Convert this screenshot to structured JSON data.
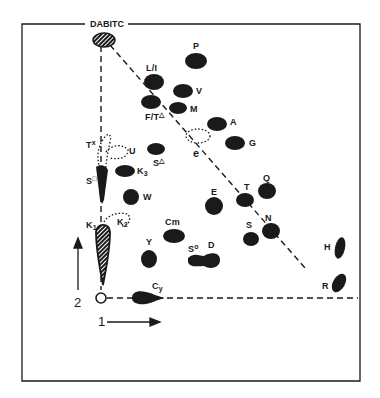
{
  "diagram": {
    "type": "2D thin-layer chromatogram",
    "reference_spot": "DABITC",
    "origin_label": "origin",
    "axes": {
      "dimension_1": {
        "label": "1",
        "direction": "right"
      },
      "dimension_2": {
        "label": "2",
        "direction": "up"
      }
    },
    "colors": {
      "ink": "#1a1a1a",
      "background": "#ffffff"
    },
    "spots": [
      {
        "id": "P",
        "label": "P"
      },
      {
        "id": "L/I",
        "label": "L/I"
      },
      {
        "id": "V",
        "label": "V"
      },
      {
        "id": "F/T",
        "label": "F/T",
        "mark": "△"
      },
      {
        "id": "M",
        "label": "M"
      },
      {
        "id": "A",
        "label": "A"
      },
      {
        "id": "G",
        "label": "G"
      },
      {
        "id": "e",
        "label": "e",
        "style": "dotted"
      },
      {
        "id": "Tx",
        "label": "T",
        "mark": "x",
        "style": "dotted"
      },
      {
        "id": "U",
        "label": "U",
        "style": "dotted"
      },
      {
        "id": "S-delta",
        "label": "S",
        "mark": "△"
      },
      {
        "id": "K3",
        "label": "K",
        "sub": "3"
      },
      {
        "id": "S-square",
        "label": "S",
        "mark": "□"
      },
      {
        "id": "W",
        "label": "W"
      },
      {
        "id": "K1",
        "label": "K",
        "sub": "1",
        "style": "hatched"
      },
      {
        "id": "K2",
        "label": "K",
        "sub": "2",
        "style": "dotted"
      },
      {
        "id": "Cm",
        "label": "Cm"
      },
      {
        "id": "Y",
        "label": "Y"
      },
      {
        "id": "S-circle",
        "label": "S",
        "mark": "o"
      },
      {
        "id": "D",
        "label": "D"
      },
      {
        "id": "E",
        "label": "E"
      },
      {
        "id": "T",
        "label": "T"
      },
      {
        "id": "Q",
        "label": "Q"
      },
      {
        "id": "S",
        "label": "S"
      },
      {
        "id": "N",
        "label": "N"
      },
      {
        "id": "H",
        "label": "H"
      },
      {
        "id": "R",
        "label": "R"
      },
      {
        "id": "Cy",
        "label": "C",
        "sub": "y"
      }
    ]
  },
  "labels": {
    "dabitc": "DABITC",
    "P": "P",
    "LI": "L/I",
    "V": "V",
    "FT": "F/T",
    "FT_mark": "△",
    "M": "M",
    "A": "A",
    "G": "G",
    "e": "e",
    "Tx": "T",
    "Tx_mark": "x",
    "U": "U",
    "Sd": "S",
    "Sd_mark": "△",
    "K": "K",
    "K3_sub": "3",
    "Ss": "S",
    "Ss_mark": "□",
    "W": "W",
    "K1_sub": "1",
    "K2_sub": "2",
    "Cm": "Cm",
    "Y": "Y",
    "So": "S",
    "So_mark": "o",
    "D": "D",
    "E": "E",
    "T": "T",
    "Q": "Q",
    "S": "S",
    "N": "N",
    "H": "H",
    "R": "R",
    "C": "C",
    "Cy_sub": "y",
    "axis1": "1",
    "axis2": "2"
  }
}
